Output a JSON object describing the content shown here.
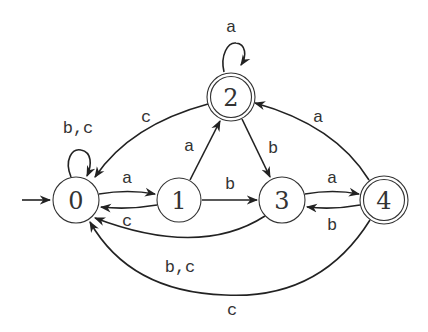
{
  "diagram": {
    "type": "finite-automaton",
    "start_state": "0",
    "states": [
      {
        "id": "0",
        "label": "0",
        "accepting": false,
        "x": 76,
        "y": 200
      },
      {
        "id": "1",
        "label": "1",
        "accepting": false,
        "x": 179,
        "y": 200
      },
      {
        "id": "2",
        "label": "2",
        "accepting": true,
        "x": 231,
        "y": 97
      },
      {
        "id": "3",
        "label": "3",
        "accepting": false,
        "x": 282,
        "y": 200
      },
      {
        "id": "4",
        "label": "4",
        "accepting": true,
        "x": 384,
        "y": 200
      }
    ],
    "transitions": [
      {
        "from": "0",
        "to": "0",
        "label": "b,c"
      },
      {
        "from": "0",
        "to": "1",
        "label": "a"
      },
      {
        "from": "1",
        "to": "0",
        "label": "c"
      },
      {
        "from": "1",
        "to": "2",
        "label": "a"
      },
      {
        "from": "1",
        "to": "3",
        "label": "b"
      },
      {
        "from": "2",
        "to": "2",
        "label": "a"
      },
      {
        "from": "2",
        "to": "0",
        "label": "c"
      },
      {
        "from": "2",
        "to": "3",
        "label": "b"
      },
      {
        "from": "3",
        "to": "4",
        "label": "a"
      },
      {
        "from": "4",
        "to": "3",
        "label": "b"
      },
      {
        "from": "3",
        "to": "0",
        "label": "b,c"
      },
      {
        "from": "4",
        "to": "2",
        "label": "a"
      },
      {
        "from": "4",
        "to": "0",
        "label": "c"
      }
    ]
  },
  "labels": {
    "s0": "0",
    "s1": "1",
    "s2": "2",
    "s3": "3",
    "s4": "4",
    "loop0": "b,c",
    "e01": "a",
    "e10": "c",
    "e12": "a",
    "e13": "b",
    "loop2": "a",
    "e20": "c",
    "e23": "b",
    "e34": "a",
    "e43": "b",
    "e30": "b,c",
    "e42": "a",
    "e40": "c"
  }
}
